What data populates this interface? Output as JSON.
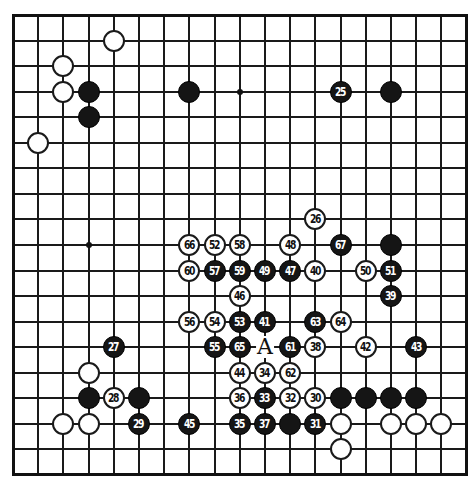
{
  "board": {
    "size": 19,
    "origin_x": 13,
    "origin_y": 15,
    "step_x": 25.2,
    "step_y": 25.55,
    "line_color": "#1a1a1a",
    "black_color": "#151515",
    "white_color": "#ffffff",
    "star_points": [
      [
        3,
        9
      ],
      [
        9,
        3
      ]
    ]
  },
  "stones": [
    {
      "color": "w",
      "col": 4,
      "row": 1,
      "n": ""
    },
    {
      "color": "w",
      "col": 2,
      "row": 2,
      "n": ""
    },
    {
      "color": "w",
      "col": 2,
      "row": 3,
      "n": ""
    },
    {
      "color": "b",
      "col": 3,
      "row": 3,
      "n": ""
    },
    {
      "color": "b",
      "col": 3,
      "row": 4,
      "n": ""
    },
    {
      "color": "w",
      "col": 1,
      "row": 5,
      "n": ""
    },
    {
      "color": "b",
      "col": 7,
      "row": 3,
      "n": ""
    },
    {
      "color": "b",
      "col": 13,
      "row": 3,
      "n": "25"
    },
    {
      "color": "b",
      "col": 15,
      "row": 3,
      "n": ""
    },
    {
      "color": "w",
      "col": 12,
      "row": 8,
      "n": "26"
    },
    {
      "color": "w",
      "col": 7,
      "row": 9,
      "n": "66"
    },
    {
      "color": "w",
      "col": 8,
      "row": 9,
      "n": "52"
    },
    {
      "color": "w",
      "col": 9,
      "row": 9,
      "n": "58"
    },
    {
      "color": "w",
      "col": 11,
      "row": 9,
      "n": "48"
    },
    {
      "color": "b",
      "col": 13,
      "row": 9,
      "n": "67"
    },
    {
      "color": "b",
      "col": 15,
      "row": 9,
      "n": ""
    },
    {
      "color": "w",
      "col": 7,
      "row": 10,
      "n": "60"
    },
    {
      "color": "b",
      "col": 8,
      "row": 10,
      "n": "57"
    },
    {
      "color": "b",
      "col": 9,
      "row": 10,
      "n": "59"
    },
    {
      "color": "b",
      "col": 10,
      "row": 10,
      "n": "49"
    },
    {
      "color": "b",
      "col": 11,
      "row": 10,
      "n": "47"
    },
    {
      "color": "w",
      "col": 12,
      "row": 10,
      "n": "40"
    },
    {
      "color": "w",
      "col": 14,
      "row": 10,
      "n": "50"
    },
    {
      "color": "b",
      "col": 15,
      "row": 10,
      "n": "51"
    },
    {
      "color": "w",
      "col": 9,
      "row": 11,
      "n": "46"
    },
    {
      "color": "b",
      "col": 15,
      "row": 11,
      "n": "39"
    },
    {
      "color": "w",
      "col": 7,
      "row": 12,
      "n": "56"
    },
    {
      "color": "w",
      "col": 8,
      "row": 12,
      "n": "54"
    },
    {
      "color": "b",
      "col": 9,
      "row": 12,
      "n": "53"
    },
    {
      "color": "b",
      "col": 10,
      "row": 12,
      "n": "41"
    },
    {
      "color": "b",
      "col": 12,
      "row": 12,
      "n": "63"
    },
    {
      "color": "w",
      "col": 13,
      "row": 12,
      "n": "64"
    },
    {
      "color": "b",
      "col": 4,
      "row": 13,
      "n": "27"
    },
    {
      "color": "b",
      "col": 8,
      "row": 13,
      "n": "55"
    },
    {
      "color": "b",
      "col": 9,
      "row": 13,
      "n": "65"
    },
    {
      "color": "b",
      "col": 11,
      "row": 13,
      "n": "61"
    },
    {
      "color": "w",
      "col": 12,
      "row": 13,
      "n": "38"
    },
    {
      "color": "w",
      "col": 14,
      "row": 13,
      "n": "42"
    },
    {
      "color": "b",
      "col": 16,
      "row": 13,
      "n": "43"
    },
    {
      "color": "w",
      "col": 3,
      "row": 14,
      "n": ""
    },
    {
      "color": "w",
      "col": 9,
      "row": 14,
      "n": "44"
    },
    {
      "color": "w",
      "col": 10,
      "row": 14,
      "n": "34"
    },
    {
      "color": "w",
      "col": 11,
      "row": 14,
      "n": "62"
    },
    {
      "color": "b",
      "col": 3,
      "row": 15,
      "n": ""
    },
    {
      "color": "w",
      "col": 4,
      "row": 15,
      "n": "28"
    },
    {
      "color": "b",
      "col": 5,
      "row": 15,
      "n": ""
    },
    {
      "color": "w",
      "col": 9,
      "row": 15,
      "n": "36"
    },
    {
      "color": "b",
      "col": 10,
      "row": 15,
      "n": "33"
    },
    {
      "color": "w",
      "col": 11,
      "row": 15,
      "n": "32"
    },
    {
      "color": "w",
      "col": 12,
      "row": 15,
      "n": "30"
    },
    {
      "color": "b",
      "col": 13,
      "row": 15,
      "n": ""
    },
    {
      "color": "b",
      "col": 14,
      "row": 15,
      "n": ""
    },
    {
      "color": "b",
      "col": 15,
      "row": 15,
      "n": ""
    },
    {
      "color": "b",
      "col": 16,
      "row": 15,
      "n": ""
    },
    {
      "color": "w",
      "col": 2,
      "row": 16,
      "n": ""
    },
    {
      "color": "w",
      "col": 3,
      "row": 16,
      "n": ""
    },
    {
      "color": "b",
      "col": 5,
      "row": 16,
      "n": "29"
    },
    {
      "color": "b",
      "col": 7,
      "row": 16,
      "n": "45"
    },
    {
      "color": "b",
      "col": 9,
      "row": 16,
      "n": "35"
    },
    {
      "color": "b",
      "col": 10,
      "row": 16,
      "n": "37"
    },
    {
      "color": "b",
      "col": 11,
      "row": 16,
      "n": ""
    },
    {
      "color": "b",
      "col": 12,
      "row": 16,
      "n": "31"
    },
    {
      "color": "w",
      "col": 13,
      "row": 16,
      "n": ""
    },
    {
      "color": "w",
      "col": 15,
      "row": 16,
      "n": ""
    },
    {
      "color": "w",
      "col": 16,
      "row": 16,
      "n": ""
    },
    {
      "color": "w",
      "col": 17,
      "row": 16,
      "n": ""
    },
    {
      "color": "w",
      "col": 13,
      "row": 17,
      "n": ""
    }
  ],
  "labels": [
    {
      "text": "A",
      "col": 10,
      "row": 13
    }
  ]
}
